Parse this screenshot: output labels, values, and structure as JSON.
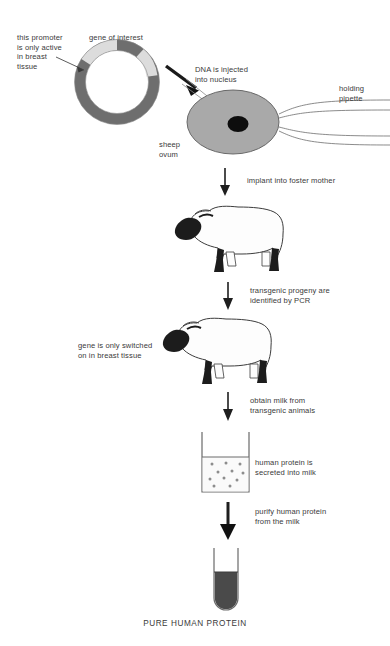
{
  "diagram": {
    "caption": "PURE HUMAN PROTEIN"
  },
  "labels": {
    "promoter": "this promoter\nis only active\nin breast\ntissue",
    "gene_of_interest": "gene of interest",
    "dna_injected": "DNA is injected\ninto nucleus",
    "holding_pipette": "holding\npipette",
    "sheep_ovum": "sheep\novum",
    "implant": "implant into foster mother",
    "pcr": "transgenic progeny are\nidentified by PCR",
    "breast_tissue": "gene is only switched\non in breast tissue",
    "obtain_milk": "obtain milk from\ntransgenic animals",
    "secreted": "human protein is\nsecreted into milk",
    "purify": "purify human protein\nfrom the milk"
  },
  "colors": {
    "plasmid_backbone": "#6e6e6e",
    "plasmid_segment": "#d9d9d9",
    "ovum_fill": "#a8a8a8",
    "nucleus": "#0d0d0d",
    "sheep_body": "#fdfdfd",
    "sheep_head": "#1a1a1a",
    "milk_fill": "#fafafa",
    "protein_fill": "#4a4a4a",
    "arrow": "#1e1e1e",
    "text": "#3a3a3a"
  },
  "elements": {
    "plasmid_name": "plasmid-ring",
    "ovum_name": "sheep-ovum",
    "pipette_name": "holding-pipette",
    "sheep1_name": "foster-mother-sheep",
    "sheep2_name": "transgenic-sheep",
    "beaker_name": "milk-beaker",
    "tube_name": "protein-test-tube",
    "milk_dots": 10
  }
}
